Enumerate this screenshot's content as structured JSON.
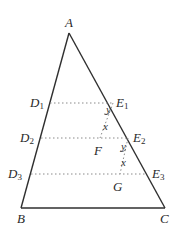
{
  "diagram": {
    "type": "triangle-with-parallel-segments",
    "colors": {
      "stroke": "#2f2f2f",
      "dotted": "#8a8a8a",
      "text": "#2a2a2a"
    },
    "vertices": {
      "A": {
        "label": "A",
        "x": 69,
        "y": 33
      },
      "B": {
        "label": "B",
        "x": 21,
        "y": 208
      },
      "C": {
        "label": "C",
        "x": 165,
        "y": 208
      }
    },
    "points": {
      "D1": {
        "base": "D",
        "sub": "1",
        "x": 50,
        "y": 103
      },
      "D2": {
        "base": "D",
        "sub": "2",
        "x": 41,
        "y": 138
      },
      "D3": {
        "base": "D",
        "sub": "3",
        "x": 31,
        "y": 174
      },
      "E1": {
        "base": "E",
        "sub": "1",
        "x": 113,
        "y": 103
      },
      "E2": {
        "base": "E",
        "sub": "2",
        "x": 128,
        "y": 138
      },
      "E3": {
        "base": "E",
        "sub": "3",
        "x": 147,
        "y": 174
      },
      "F": {
        "label": "F",
        "x": 100,
        "y": 138
      },
      "G": {
        "label": "G",
        "x": 120,
        "y": 174
      }
    },
    "segments": {
      "solid": [
        "AB",
        "AC",
        "BC"
      ],
      "dotted": [
        "D1E1",
        "D2E2",
        "D3E3",
        "E1F",
        "E2G"
      ]
    },
    "angle_labels": [
      {
        "text": "y",
        "at": "E1",
        "x": 106,
        "y": 110
      },
      {
        "text": "x",
        "at": "F",
        "x": 103,
        "y": 126
      },
      {
        "text": "y",
        "at": "E2",
        "x": 121,
        "y": 146
      },
      {
        "text": "x",
        "at": "G",
        "x": 121,
        "y": 162
      }
    ]
  }
}
